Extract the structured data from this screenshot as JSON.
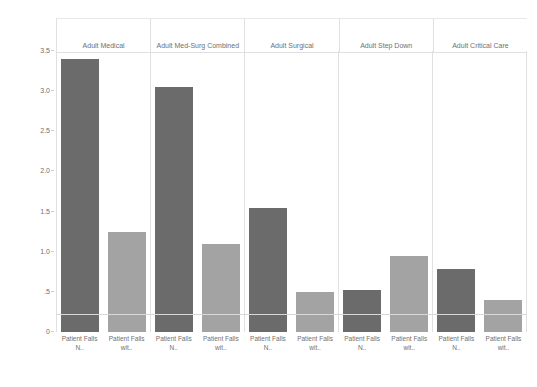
{
  "chart_data": {
    "type": "bar",
    "title": "",
    "xlabel": "",
    "ylabel": "Rate of Patient Falls (per 1,000 patient days)",
    "ylim": [
      0,
      3.5
    ],
    "grid": false,
    "legend_position": "none",
    "ytick_labels": [
      "3.5",
      "3.0",
      "2.5",
      "2.0",
      "1.5",
      "1.0",
      ".5",
      "0"
    ],
    "ytick_values": [
      3.5,
      3.0,
      2.5,
      2.0,
      1.5,
      1.0,
      0.5,
      0
    ],
    "categories": [
      "Patient Falls N..",
      "Patient Falls wit.."
    ],
    "panels": [
      {
        "label": "Adult Medical",
        "bars": [
          {
            "category": "Patient Falls N..",
            "value": 3.4,
            "color": "#6b6b6b"
          },
          {
            "category": "Patient Falls wit..",
            "value": 1.25,
            "color": "#a3a3a3"
          }
        ]
      },
      {
        "label": "Adult Med-Surg Combined",
        "bars": [
          {
            "category": "Patient Falls N..",
            "value": 3.05,
            "color": "#6b6b6b"
          },
          {
            "category": "Patient Falls wit..",
            "value": 1.1,
            "color": "#a3a3a3"
          }
        ]
      },
      {
        "label": "Adult Surgical",
        "bars": [
          {
            "category": "Patient Falls N..",
            "value": 1.55,
            "color": "#6b6b6b"
          },
          {
            "category": "Patient Falls wit..",
            "value": 0.5,
            "color": "#a3a3a3"
          }
        ]
      },
      {
        "label": "Adult Step Down",
        "bars": [
          {
            "category": "Patient Falls N..",
            "value": 0.52,
            "color": "#6b6b6b"
          },
          {
            "category": "Patient Falls wit..",
            "value": 0.95,
            "color": "#a3a3a3"
          }
        ]
      },
      {
        "label": "Adult Critical Care",
        "bars": [
          {
            "category": "Patient Falls N..",
            "value": 0.78,
            "color": "#6b6b6b"
          },
          {
            "category": "Patient Falls wit..",
            "value": 0.4,
            "color": "#a3a3a3"
          }
        ]
      }
    ],
    "colors": {
      "series_dark": "#6b6b6b",
      "series_light": "#a3a3a3",
      "grid_line": "#e0e0e0",
      "text": "#707070",
      "background": "#ffffff"
    }
  }
}
